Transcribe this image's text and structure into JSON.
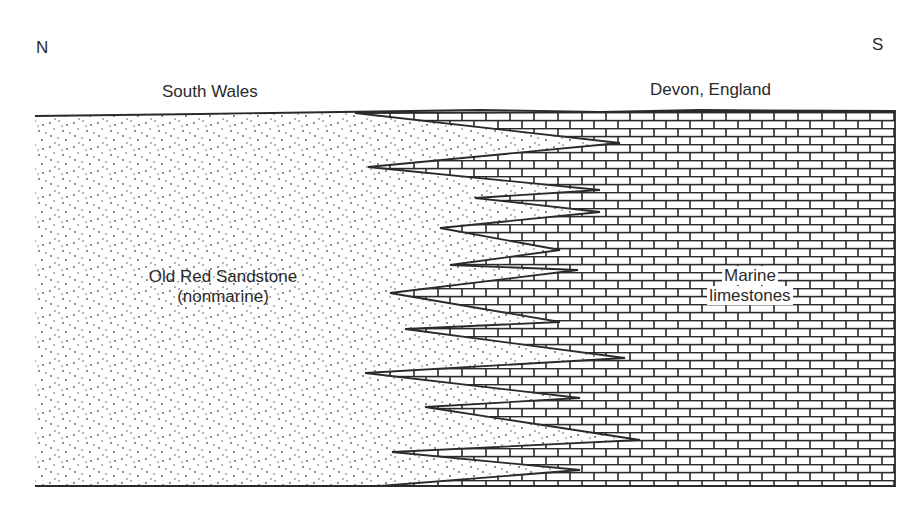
{
  "orientation": {
    "left": "N",
    "right": "S"
  },
  "locations": {
    "left": "South Wales",
    "right": "Devon, England"
  },
  "units": {
    "sandstone": {
      "line1": "Old Red Sandstone",
      "line2": "(nonmarine)",
      "pattern": "stipple-dots"
    },
    "limestone": {
      "line1": "Marine",
      "line2": "limestones",
      "pattern": "brick"
    }
  },
  "diagram": {
    "type": "geologic-cross-section",
    "colors": {
      "ink": "#2a2a2a",
      "background": "#ffffff"
    },
    "interfinger_tongues": 9
  }
}
